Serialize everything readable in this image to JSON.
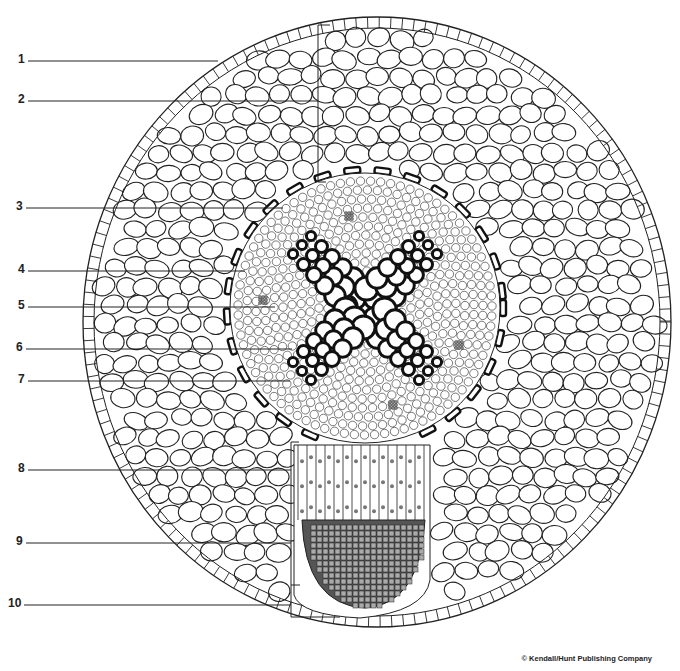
{
  "figure": {
    "copyright": "© Kendall/Hunt Publishing Company"
  },
  "labels": [
    {
      "num": "1",
      "x": 18,
      "y": 60,
      "line_end_x": 218,
      "line_y": 61
    },
    {
      "num": "2",
      "x": 18,
      "y": 99,
      "line_end_x": 318,
      "line_y": 101
    },
    {
      "num": "3",
      "x": 16,
      "y": 206,
      "line_end_x": 283,
      "line_y": 208
    },
    {
      "num": "4",
      "x": 18,
      "y": 269,
      "line_end_x": 245,
      "line_y": 271
    },
    {
      "num": "5",
      "x": 18,
      "y": 305,
      "line_end_x": 275,
      "line_y": 307
    },
    {
      "num": "6",
      "x": 16,
      "y": 346,
      "line_end_x": 292,
      "line_y": 349
    },
    {
      "num": "7",
      "x": 18,
      "y": 378,
      "line_end_x": 290,
      "line_y": 381
    },
    {
      "num": "8",
      "x": 18,
      "y": 465,
      "line_end_x": 291,
      "line_y": 470
    },
    {
      "num": "9",
      "x": 16,
      "y": 539,
      "line_end_x": 291,
      "line_y": 543
    },
    {
      "num": "10",
      "x": 8,
      "y": 601,
      "line_end_x": 291,
      "line_y": 605
    }
  ],
  "brackets": [
    {
      "x": 318,
      "y1": 25,
      "y2": 182,
      "tick_top": 330,
      "tick_bottom": 326
    },
    {
      "x": 291,
      "y1": 442,
      "y2": 617,
      "tick_mid_y": 585,
      "tick_mid": 300,
      "tick_bottom": 340
    }
  ],
  "colors": {
    "ink": "#222222",
    "background": "#ffffff",
    "xylem": "#111111",
    "meristem": "#555555"
  }
}
